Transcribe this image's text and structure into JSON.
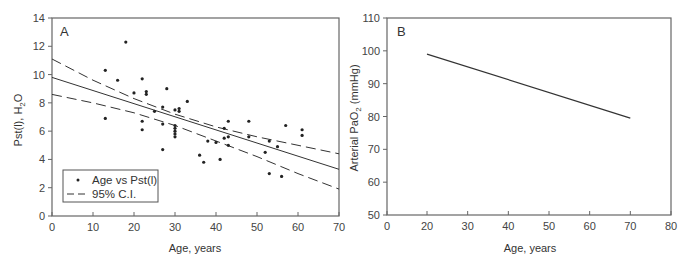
{
  "chart_data": [
    {
      "panel": "A",
      "type": "scatter",
      "title": "",
      "panel_label": "A",
      "xlabel": "Age, years",
      "ylabel": "Pst(l), H2O",
      "ylabel_main": "Pst(l), H",
      "ylabel_sub": "2",
      "ylabel_tail": "O",
      "xlim": [
        0,
        70
      ],
      "ylim": [
        0,
        14
      ],
      "xticks": [
        0,
        10,
        20,
        30,
        40,
        50,
        60,
        70
      ],
      "yticks": [
        0,
        2,
        4,
        6,
        8,
        10,
        12,
        14
      ],
      "grid": false,
      "legend_position": "lower-left",
      "legend": [
        {
          "label": "Age vs Pst(l)",
          "marker": "dot"
        },
        {
          "label": "95% C.I.",
          "marker": "dashed-line"
        }
      ],
      "series": [
        {
          "name": "Age vs Pst(l)",
          "kind": "scatter",
          "points": [
            [
              13,
              10.3
            ],
            [
              13,
              6.9
            ],
            [
              16,
              9.6
            ],
            [
              18,
              12.3
            ],
            [
              20,
              8.7
            ],
            [
              22,
              9.7
            ],
            [
              22,
              6.7
            ],
            [
              22,
              6.1
            ],
            [
              23,
              8.8
            ],
            [
              23,
              8.6
            ],
            [
              25,
              7.4
            ],
            [
              27,
              7.7
            ],
            [
              27,
              6.5
            ],
            [
              27,
              4.7
            ],
            [
              28,
              9.0
            ],
            [
              30,
              7.5
            ],
            [
              30,
              6.4
            ],
            [
              30,
              6.2
            ],
            [
              30,
              6.0
            ],
            [
              30,
              5.8
            ],
            [
              30,
              5.6
            ],
            [
              31,
              7.6
            ],
            [
              31,
              7.4
            ],
            [
              33,
              8.1
            ],
            [
              36,
              4.3
            ],
            [
              37,
              3.8
            ],
            [
              38,
              5.3
            ],
            [
              40,
              5.2
            ],
            [
              41,
              4.0
            ],
            [
              42,
              6.2
            ],
            [
              42,
              5.5
            ],
            [
              43,
              6.7
            ],
            [
              43,
              5.0
            ],
            [
              43,
              5.6
            ],
            [
              48,
              6.7
            ],
            [
              48,
              5.6
            ],
            [
              52,
              4.5
            ],
            [
              53,
              3.0
            ],
            [
              53,
              5.3
            ],
            [
              55,
              4.9
            ],
            [
              56,
              2.8
            ],
            [
              57,
              6.4
            ],
            [
              61,
              6.1
            ],
            [
              61,
              5.7
            ]
          ]
        },
        {
          "name": "Regression",
          "kind": "line-solid",
          "points": [
            [
              0,
              9.8
            ],
            [
              70,
              3.3
            ]
          ]
        },
        {
          "name": "95% C.I. upper",
          "kind": "line-dashed",
          "points": [
            [
              0,
              11.1
            ],
            [
              10,
              9.6
            ],
            [
              20,
              8.3
            ],
            [
              30,
              7.2
            ],
            [
              40,
              6.3
            ],
            [
              50,
              5.6
            ],
            [
              60,
              5.0
            ],
            [
              70,
              4.4
            ]
          ]
        },
        {
          "name": "95% C.I. lower",
          "kind": "line-dashed",
          "points": [
            [
              0,
              8.6
            ],
            [
              10,
              8.0
            ],
            [
              20,
              7.3
            ],
            [
              30,
              6.4
            ],
            [
              40,
              5.3
            ],
            [
              50,
              4.2
            ],
            [
              60,
              3.0
            ],
            [
              70,
              1.9
            ]
          ]
        }
      ]
    },
    {
      "panel": "B",
      "type": "line",
      "title": "",
      "panel_label": "B",
      "xlabel": "Age, years",
      "ylabel": "Arterial PaO2 (mmHg)",
      "ylabel_main": "Arterial PaO",
      "ylabel_sub": "2",
      "ylabel_tail": " (mmHg)",
      "xlim": [
        0,
        80
      ],
      "ylim": [
        50,
        110
      ],
      "xticks": [
        0,
        20,
        30,
        40,
        50,
        60,
        70,
        80
      ],
      "yticks": [
        50,
        60,
        70,
        80,
        90,
        100,
        110
      ],
      "grid": false,
      "series": [
        {
          "name": "Arterial PaO2",
          "kind": "line-solid",
          "points": [
            [
              20,
              99
            ],
            [
              70,
              79.5
            ]
          ]
        }
      ]
    }
  ],
  "colors": {
    "axis": "#555555",
    "data": "#222222",
    "background": "#ffffff"
  }
}
